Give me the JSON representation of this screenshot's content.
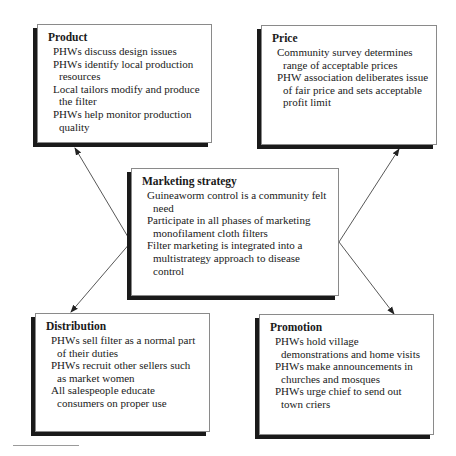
{
  "diagram": {
    "center": {
      "title": "Marketing strategy",
      "items": [
        "Guineaworm control is a community felt need",
        "Participate in all phases of marketing monofilament cloth filters",
        "Filter marketing is integrated into a multistrategy approach to disease control"
      ]
    },
    "product": {
      "title": "Product",
      "items": [
        "PHWs discuss design issues",
        "PHWs identify local production resources",
        "Local tailors modify and produce the filter",
        "PHWs help monitor production quality"
      ]
    },
    "price": {
      "title": "Price",
      "items": [
        "Community survey determines range of acceptable prices",
        "PHW association deliberates issue of fair price and sets acceptable profit limit"
      ]
    },
    "distribution": {
      "title": "Distribution",
      "items": [
        "PHWs sell filter as a normal part of their duties",
        "PHWs recruit other sellers such as market women",
        "All salespeople educate consumers on proper use"
      ]
    },
    "promotion": {
      "title": "Promotion",
      "items": [
        "PHWs hold village demonstrations and home visits",
        "PHWs make announcements in churches and mosques",
        "PHWs urge chief to send out town criers"
      ]
    },
    "connections": [
      {
        "from": "center",
        "to": "product"
      },
      {
        "from": "center",
        "to": "price"
      },
      {
        "from": "center",
        "to": "distribution"
      },
      {
        "from": "center",
        "to": "promotion"
      }
    ],
    "colors": {
      "border": "#8a8a8a",
      "shadow": "#1a1a1a",
      "arrow": "#333333"
    }
  }
}
